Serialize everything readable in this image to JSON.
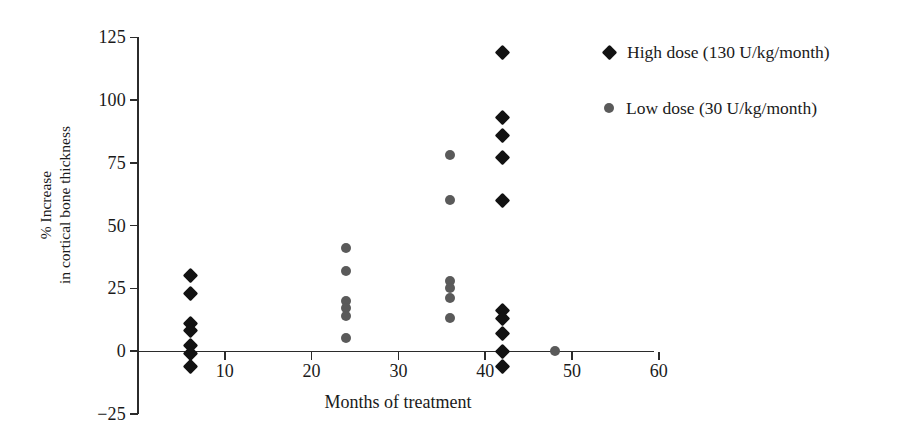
{
  "chart_data": {
    "type": "scatter",
    "title": "",
    "xlabel": "Months of treatment",
    "ylabel": "% Increase\nin cortical bone thickness",
    "ylabel_line1": "% Increase",
    "ylabel_line2": "in cortical bone thickness",
    "xlim": [
      0,
      60
    ],
    "ylim": [
      -25,
      125
    ],
    "xticks": [
      10,
      20,
      30,
      40,
      50,
      60
    ],
    "yticks": [
      -25,
      0,
      25,
      50,
      75,
      100,
      125
    ],
    "xtick_labels": [
      "10",
      "20",
      "30",
      "40",
      "50",
      "60"
    ],
    "ytick_labels": [
      "-25",
      "0",
      "25",
      "50",
      "75",
      "100",
      "125"
    ],
    "grid": false,
    "legend_position": "right",
    "series": [
      {
        "name": "High dose (130 U/kg/month)",
        "marker": "diamond",
        "color": "#121212",
        "points": [
          {
            "x": 6,
            "y": 30
          },
          {
            "x": 6,
            "y": 23
          },
          {
            "x": 6,
            "y": 11
          },
          {
            "x": 6,
            "y": 8
          },
          {
            "x": 6,
            "y": 2
          },
          {
            "x": 6,
            "y": -1
          },
          {
            "x": 6,
            "y": -6
          },
          {
            "x": 42,
            "y": 119
          },
          {
            "x": 42,
            "y": 93
          },
          {
            "x": 42,
            "y": 86
          },
          {
            "x": 42,
            "y": 77
          },
          {
            "x": 42,
            "y": 60
          },
          {
            "x": 42,
            "y": 16
          },
          {
            "x": 42,
            "y": 13
          },
          {
            "x": 42,
            "y": 7
          },
          {
            "x": 42,
            "y": 0
          },
          {
            "x": 42,
            "y": -6
          }
        ]
      },
      {
        "name": "Low dose (30 U/kg/month)",
        "marker": "circle",
        "color": "#5a5a5a",
        "points": [
          {
            "x": 24,
            "y": 41
          },
          {
            "x": 24,
            "y": 32
          },
          {
            "x": 24,
            "y": 20
          },
          {
            "x": 24,
            "y": 17
          },
          {
            "x": 24,
            "y": 14
          },
          {
            "x": 24,
            "y": 5
          },
          {
            "x": 36,
            "y": 78
          },
          {
            "x": 36,
            "y": 60
          },
          {
            "x": 36,
            "y": 28
          },
          {
            "x": 36,
            "y": 25
          },
          {
            "x": 36,
            "y": 21
          },
          {
            "x": 36,
            "y": 13
          },
          {
            "x": 48,
            "y": 0
          }
        ]
      }
    ]
  },
  "legend": {
    "items": [
      {
        "label": "High dose (130 U/kg/month)",
        "marker": "high"
      },
      {
        "label": "Low dose (30 U/kg/month)",
        "marker": "low"
      }
    ]
  }
}
